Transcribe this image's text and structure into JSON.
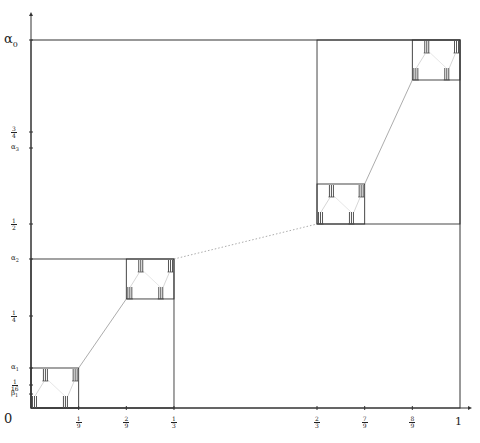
{
  "figure": {
    "origin_px": [
      31,
      408
    ],
    "scale_px": [
      429,
      368
    ],
    "axis_color": "#333333",
    "box_color": "#333333",
    "connector_color": "#888888",
    "x_axis": {
      "end_label": "1",
      "origin_label": "0",
      "ticks": [
        {
          "value": 0.1111,
          "num": "1",
          "den": "9"
        },
        {
          "value": 0.2222,
          "num": "2",
          "den": "9"
        },
        {
          "value": 0.3333,
          "num": "1",
          "den": "3"
        },
        {
          "value": 0.6667,
          "num": "2",
          "den": "3"
        },
        {
          "value": 0.7778,
          "num": "7",
          "den": "9"
        },
        {
          "value": 0.8889,
          "num": "8",
          "den": "9"
        }
      ]
    },
    "y_axis": {
      "ticks": [
        {
          "value": 1.0,
          "label": "α0",
          "big": true
        },
        {
          "value": 0.75,
          "num": "3",
          "den": "4"
        },
        {
          "value": 0.7065,
          "label": "α3"
        },
        {
          "value": 0.5,
          "num": "1",
          "den": "2"
        },
        {
          "value": 0.4049,
          "label": "α2"
        },
        {
          "value": 0.25,
          "num": "1",
          "den": "4"
        },
        {
          "value": 0.1087,
          "label": "α1"
        },
        {
          "value": 0.0625,
          "num": "1",
          "den": "16"
        },
        {
          "value": 0.038,
          "label": "β1"
        }
      ]
    },
    "boxes": [
      {
        "x0": 0,
        "x1": 1,
        "y0": 0,
        "y1": 1,
        "level": 0
      },
      {
        "x0": 0,
        "x1": 0.3333,
        "y0": 0,
        "y1": 0.4049,
        "level": 1
      },
      {
        "x0": 0.6667,
        "x1": 1,
        "y0": 0.5,
        "y1": 1,
        "level": 1
      },
      {
        "x0": 0,
        "x1": 0.1111,
        "y0": 0,
        "y1": 0.1087,
        "level": 2
      },
      {
        "x0": 0.2222,
        "x1": 0.3333,
        "y0": 0.2963,
        "y1": 0.4049,
        "level": 2
      },
      {
        "x0": 0.6667,
        "x1": 0.7778,
        "y0": 0.5,
        "y1": 0.6087,
        "level": 2
      },
      {
        "x0": 0.8889,
        "x1": 1,
        "y0": 0.8913,
        "y1": 1,
        "level": 2
      }
    ],
    "connectors": [
      {
        "from": [
          0.3333,
          0.4049
        ],
        "to": [
          0.6667,
          0.5
        ],
        "style": "dotted"
      },
      {
        "from": [
          0.1111,
          0.1087
        ],
        "to": [
          0.2222,
          0.2963
        ],
        "style": "solid"
      },
      {
        "from": [
          0.7778,
          0.6087
        ],
        "to": [
          0.8889,
          0.8913
        ],
        "style": "solid"
      }
    ],
    "caption": "Figure"
  }
}
